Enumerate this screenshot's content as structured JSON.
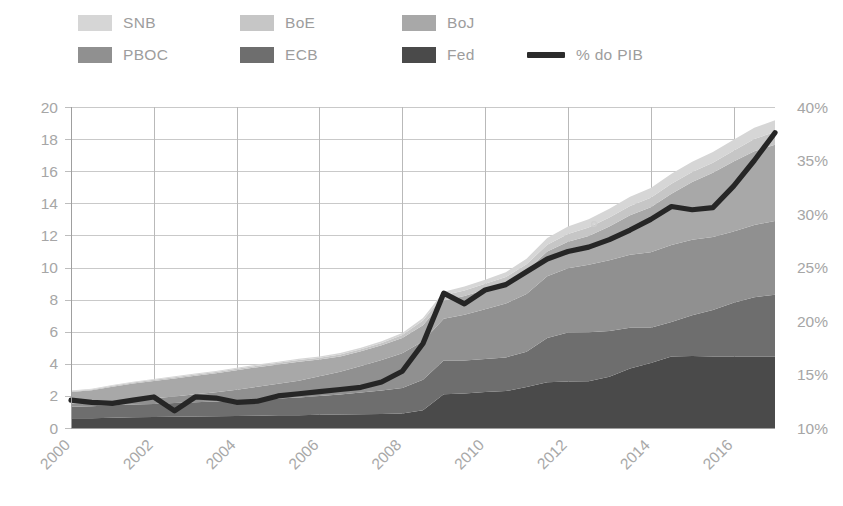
{
  "legend": {
    "items": [
      {
        "label": "SNB",
        "color": "#d6d6d6",
        "type": "swatch",
        "row": 1,
        "col": 1
      },
      {
        "label": "BoE",
        "color": "#c6c6c6",
        "type": "swatch",
        "row": 1,
        "col": 2
      },
      {
        "label": "BoJ",
        "color": "#a8a8a8",
        "type": "swatch",
        "row": 1,
        "col": 3
      },
      {
        "label": "PBOC",
        "color": "#909090",
        "type": "swatch",
        "row": 2,
        "col": 1
      },
      {
        "label": "ECB",
        "color": "#6e6e6e",
        "type": "swatch",
        "row": 2,
        "col": 2
      },
      {
        "label": "Fed",
        "color": "#4a4a4a",
        "type": "swatch",
        "row": 2,
        "col": 3
      },
      {
        "label": "% do PIB",
        "color": "#2b2b2b",
        "type": "line",
        "row": 2,
        "col": 4
      }
    ]
  },
  "chart_data": {
    "type": "area",
    "stacked": true,
    "title": "",
    "xlabel": "",
    "ylabel": "",
    "y2label": "",
    "grid": true,
    "legend_position": "top",
    "x": [
      2000,
      2000.5,
      2001,
      2001.5,
      2002,
      2002.5,
      2003,
      2003.5,
      2004,
      2004.5,
      2005,
      2005.5,
      2006,
      2006.5,
      2007,
      2007.5,
      2008,
      2008.5,
      2009,
      2009.5,
      2010,
      2010.5,
      2011,
      2011.5,
      2012,
      2012.5,
      2013,
      2013.5,
      2014,
      2014.5,
      2015,
      2015.5,
      2016,
      2016.5,
      2017
    ],
    "xticks": [
      2000,
      2002,
      2004,
      2006,
      2008,
      2010,
      2012,
      2014,
      2016
    ],
    "xlim": [
      2000,
      2017
    ],
    "ylim": [
      0,
      20
    ],
    "yticks": [
      0,
      2,
      4,
      6,
      8,
      10,
      12,
      14,
      16,
      18,
      20
    ],
    "y2lim": [
      10,
      40
    ],
    "y2ticks": [
      "10%",
      "15%",
      "20%",
      "25%",
      "30%",
      "35%",
      "40%"
    ],
    "y2tick_values": [
      10,
      15,
      20,
      25,
      30,
      35,
      40
    ],
    "units_left": "USD trillions",
    "series": [
      {
        "name": "Fed",
        "color": "#4a4a4a",
        "values": [
          0.6,
          0.61,
          0.64,
          0.67,
          0.68,
          0.7,
          0.72,
          0.73,
          0.75,
          0.77,
          0.79,
          0.8,
          0.82,
          0.84,
          0.86,
          0.88,
          0.9,
          1.1,
          2.1,
          2.15,
          2.25,
          2.3,
          2.55,
          2.85,
          2.9,
          2.92,
          3.2,
          3.7,
          4.05,
          4.45,
          4.48,
          4.45,
          4.45,
          4.45,
          4.45
        ]
      },
      {
        "name": "ECB",
        "color": "#6e6e6e",
        "values": [
          0.72,
          0.74,
          0.78,
          0.8,
          0.82,
          0.85,
          0.88,
          0.92,
          0.95,
          1.0,
          1.05,
          1.1,
          1.18,
          1.25,
          1.35,
          1.45,
          1.6,
          1.9,
          2.1,
          2.05,
          2.05,
          2.1,
          2.2,
          2.75,
          3.05,
          3.05,
          2.85,
          2.55,
          2.2,
          2.15,
          2.55,
          2.9,
          3.35,
          3.7,
          3.85
        ]
      },
      {
        "name": "PBOC",
        "color": "#909090",
        "values": [
          0.2,
          0.22,
          0.25,
          0.3,
          0.35,
          0.42,
          0.5,
          0.58,
          0.68,
          0.8,
          0.92,
          1.05,
          1.22,
          1.42,
          1.65,
          1.9,
          2.15,
          2.4,
          2.6,
          2.85,
          3.1,
          3.35,
          3.6,
          3.85,
          4.0,
          4.2,
          4.4,
          4.55,
          4.7,
          4.8,
          4.7,
          4.55,
          4.45,
          4.5,
          4.6
        ]
      },
      {
        "name": "BoJ",
        "color": "#a8a8a8",
        "values": [
          0.72,
          0.78,
          0.9,
          1.0,
          1.08,
          1.12,
          1.15,
          1.18,
          1.22,
          1.22,
          1.2,
          1.18,
          1.05,
          0.95,
          0.92,
          0.92,
          0.95,
          1.0,
          1.15,
          1.18,
          1.22,
          1.28,
          1.45,
          1.55,
          1.65,
          1.8,
          2.1,
          2.45,
          2.8,
          3.2,
          3.6,
          4.0,
          4.35,
          4.6,
          4.75
        ]
      },
      {
        "name": "BoE",
        "color": "#c6c6c6",
        "values": [
          0.05,
          0.05,
          0.06,
          0.06,
          0.07,
          0.07,
          0.08,
          0.08,
          0.09,
          0.09,
          0.1,
          0.1,
          0.11,
          0.12,
          0.13,
          0.15,
          0.2,
          0.3,
          0.32,
          0.34,
          0.36,
          0.38,
          0.4,
          0.42,
          0.48,
          0.52,
          0.56,
          0.58,
          0.6,
          0.62,
          0.62,
          0.63,
          0.68,
          0.76,
          0.8
        ]
      },
      {
        "name": "SNB",
        "color": "#d6d6d6",
        "values": [
          0.04,
          0.04,
          0.05,
          0.05,
          0.05,
          0.06,
          0.06,
          0.06,
          0.07,
          0.07,
          0.07,
          0.08,
          0.08,
          0.09,
          0.09,
          0.1,
          0.12,
          0.16,
          0.22,
          0.24,
          0.26,
          0.3,
          0.35,
          0.42,
          0.48,
          0.52,
          0.55,
          0.58,
          0.6,
          0.62,
          0.64,
          0.66,
          0.68,
          0.7,
          0.72
        ]
      }
    ],
    "line_series": {
      "name": "% do PIB",
      "color": "#262626",
      "axis": "right",
      "values": [
        12.6,
        12.4,
        12.3,
        12.6,
        12.9,
        11.6,
        12.9,
        12.8,
        12.4,
        12.5,
        13.0,
        13.2,
        13.4,
        13.6,
        13.8,
        14.3,
        15.3,
        17.9,
        22.6,
        21.6,
        22.9,
        23.4,
        24.6,
        25.8,
        26.5,
        26.9,
        27.6,
        28.5,
        29.5,
        30.7,
        30.4,
        30.6,
        32.6,
        35.0,
        37.6
      ]
    }
  }
}
